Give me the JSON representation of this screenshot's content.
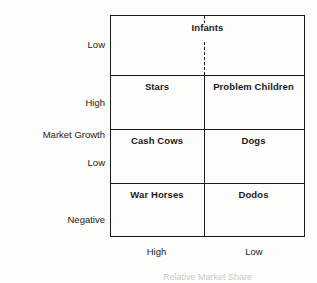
{
  "chart_data": {
    "type": "table",
    "title": "",
    "xlabel": "Relative Market Share",
    "ylabel": "Market Growth",
    "x_tick_labels": [
      "High",
      "Low"
    ],
    "y_tick_labels": [
      "Low",
      "High",
      "Low",
      "Negative"
    ],
    "grid": true,
    "legend": "none",
    "columns": [
      "High",
      "Low"
    ],
    "rows": [
      {
        "growth": "Low",
        "cells": [
          "Infants"
        ],
        "spans_full_width": true,
        "divider": "dashed"
      },
      {
        "growth": "High",
        "cells": [
          "Stars",
          "Problem Children"
        ],
        "spans_full_width": false,
        "divider": "solid"
      },
      {
        "growth": "Low",
        "cells": [
          "Cash Cows",
          "Dogs"
        ],
        "spans_full_width": false,
        "divider": "solid"
      },
      {
        "growth": "Negative",
        "cells": [
          "War Horses",
          "Dodos"
        ],
        "spans_full_width": false,
        "divider": "solid"
      }
    ],
    "values": []
  },
  "matrix": {
    "top_band": {
      "label": "Infants"
    },
    "rows": [
      {
        "left": "Stars",
        "right": "Problem Children"
      },
      {
        "left": "Cash Cows",
        "right": "Dogs"
      },
      {
        "left": "War Horses",
        "right": "Dodos"
      }
    ]
  },
  "y_axis": {
    "title": "Market Growth",
    "ticks": {
      "low_top": "Low",
      "high": "High",
      "low_mid": "Low",
      "negative": "Negative"
    }
  },
  "x_axis": {
    "title": "Relative Market Share",
    "ticks": {
      "high": "High",
      "low": "Low"
    }
  },
  "colors": {
    "background": "#fdfdfc",
    "line": "#1a1a1a",
    "text": "#1a1a1a"
  }
}
